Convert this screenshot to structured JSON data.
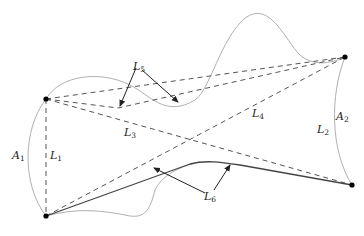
{
  "diagram": {
    "points": {
      "p_top_left": [
        46,
        99
      ],
      "p_bottom_left": [
        46,
        216
      ],
      "p_top_right": [
        345,
        57
      ],
      "p_bottom_right": [
        352,
        185
      ]
    },
    "labels": {
      "A1": {
        "base": "A",
        "sub": "1"
      },
      "A2": {
        "base": "A",
        "sub": "2"
      },
      "L1": {
        "base": "L",
        "sub": "1"
      },
      "L2": {
        "base": "L",
        "sub": "2"
      },
      "L3": {
        "base": "L",
        "sub": "3"
      },
      "L4": {
        "base": "L",
        "sub": "4"
      },
      "L5": {
        "base": "L",
        "sub": "5"
      },
      "L6": {
        "base": "L",
        "sub": "6"
      }
    },
    "colors": {
      "curve": "#b0b0b0",
      "dashed": "#555555",
      "solid": "#444444",
      "point": "#000000",
      "arrow": "#222222"
    }
  }
}
